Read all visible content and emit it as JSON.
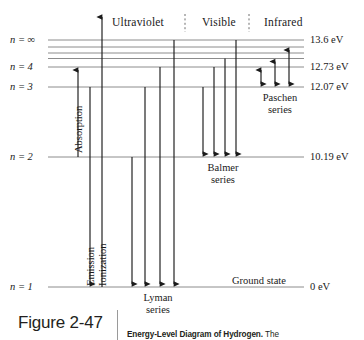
{
  "figure": {
    "number": "Figure 2-47",
    "caption_title": "Energy-Level Diagram of Hydrogen.",
    "caption_tail": "The"
  },
  "spectrum_bands": [
    {
      "name": "ultraviolet",
      "label": "Ultraviolet",
      "x": 112,
      "y": 17
    },
    {
      "name": "visible",
      "label": "Visible",
      "x": 202,
      "y": 17
    },
    {
      "name": "infrared",
      "label": "Infrared",
      "x": 264,
      "y": 17
    }
  ],
  "band_dividers": [
    {
      "name": "uv-visible-divider",
      "x": 185,
      "y1": 14,
      "y2": 32
    },
    {
      "name": "visible-infrared-divider",
      "x": 249,
      "y1": 14,
      "y2": 32
    }
  ],
  "levels": [
    {
      "name": "n-infinity",
      "label": "n = ∞",
      "energy": "13.6 eV",
      "y": 40,
      "labeled": true
    },
    {
      "name": "n-7",
      "label": "",
      "energy": "",
      "y": 47,
      "labeled": false
    },
    {
      "name": "n-6",
      "label": "",
      "energy": "",
      "y": 53,
      "labeled": false
    },
    {
      "name": "n-5",
      "label": "",
      "energy": "",
      "y": 58.5,
      "labeled": false
    },
    {
      "name": "n-4",
      "label": "n = 4",
      "energy": "12.73 eV",
      "y": 67,
      "labeled": true
    },
    {
      "name": "n-3",
      "label": "n = 3",
      "energy": "12.07 eV",
      "y": 87,
      "labeled": true
    },
    {
      "name": "n-2",
      "label": "n = 2",
      "energy": "10.19 eV",
      "y": 157,
      "labeled": true
    },
    {
      "name": "n-1",
      "label": "n = 1",
      "energy": "0 eV",
      "y": 287,
      "labeled": true
    }
  ],
  "ground_state": {
    "label": "Ground state",
    "x": 232,
    "y": 281
  },
  "process_arrows": [
    {
      "name": "absorption-arrow",
      "label": "Absorption",
      "x": 78,
      "y_from": 157,
      "y_to": 67,
      "head": "up",
      "label_x": 74,
      "label_y": 152
    },
    {
      "name": "emission-arrow",
      "label": "Emission",
      "x": 90,
      "y_from": 87,
      "y_to": 287,
      "head": "down",
      "label_x": 86,
      "label_y": 285
    },
    {
      "name": "ionization-arrow",
      "label": "Ionization",
      "x": 102,
      "y_from": 287,
      "y_to": 14,
      "head": "up",
      "label_x": 98,
      "label_y": 285
    }
  ],
  "series": [
    {
      "name": "lyman-series",
      "label": "Lyman\nseries",
      "label_line1": "Lyman",
      "label_line2": "series",
      "label_x": 155,
      "label_y": 292,
      "base_level": "n-1",
      "base_y": 287,
      "direction": "down",
      "transitions": [
        {
          "name": "lyman-alpha",
          "x": 132,
          "top_y": 157
        },
        {
          "name": "lyman-beta",
          "x": 145,
          "top_y": 87
        },
        {
          "name": "lyman-gamma",
          "x": 160,
          "top_y": 67
        },
        {
          "name": "lyman-delta",
          "x": 174,
          "top_y": 40
        }
      ]
    },
    {
      "name": "balmer-series",
      "label_line1": "Balmer",
      "label_line2": "series",
      "label_x": 222,
      "label_y": 162,
      "base_level": "n-2",
      "base_y": 157,
      "direction": "down",
      "transitions": [
        {
          "name": "balmer-alpha",
          "x": 203,
          "top_y": 87
        },
        {
          "name": "balmer-beta",
          "x": 214,
          "top_y": 67
        },
        {
          "name": "balmer-gamma",
          "x": 225,
          "top_y": 58.5
        },
        {
          "name": "balmer-delta",
          "x": 236,
          "top_y": 40
        }
      ]
    },
    {
      "name": "paschen-series",
      "label_line1": "Paschen",
      "label_line2": "series",
      "label_x": 278,
      "label_y": 92,
      "base_level": "n-3",
      "base_y": 87,
      "direction": "both",
      "transitions": [
        {
          "name": "paschen-alpha",
          "x": 261,
          "top_y": 67
        },
        {
          "name": "paschen-beta",
          "x": 275,
          "top_y": 58.5
        },
        {
          "name": "paschen-gamma",
          "x": 289,
          "top_y": 47
        }
      ]
    }
  ],
  "geometry": {
    "level_x_start": 48,
    "level_x_end": 304,
    "energy_label_x": 310,
    "level_label_x": 8
  },
  "colors": {
    "level_line": "#8c8c8c",
    "arrow": "#1a1a1a",
    "text": "#1a1a1a",
    "band_divider": "#6e6e6e",
    "caption_rule": "#9a9a9a",
    "background": "#ffffff"
  }
}
